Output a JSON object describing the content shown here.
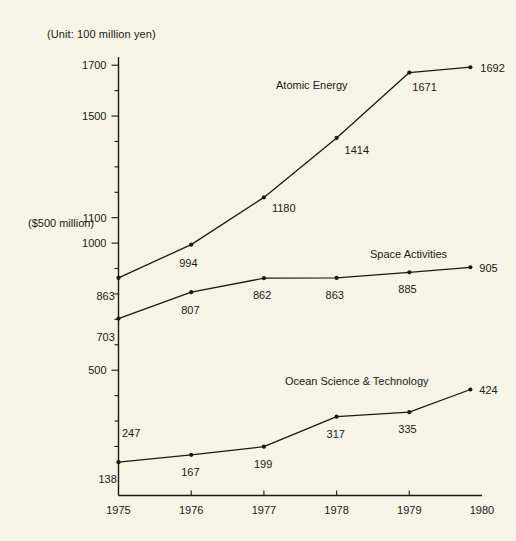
{
  "notes": {
    "unit": "(Unit: 100 million yen)",
    "axis_secondary": "($500 million)"
  },
  "floating_labels": [
    {
      "name": "floating-value-247",
      "text": "247",
      "x": 122,
      "y": 437
    }
  ],
  "chart_data": {
    "type": "line",
    "title": "",
    "subtitle": "",
    "xlabel": "",
    "ylabel": "",
    "unit_note": "(Unit: 100 million yen)",
    "secondary_axis_note": "($500 million)",
    "grid": false,
    "legend_position": "inline-labels",
    "x": [
      1975,
      1976,
      1977,
      1978,
      1979,
      1980
    ],
    "categories": [
      "1975",
      "1976",
      "1977",
      "1978",
      "1979",
      "1980"
    ],
    "xlim": [
      1975,
      1980
    ],
    "ylim": [
      0,
      1750
    ],
    "y_labeled_ticks": [
      1700,
      1500,
      1100,
      1000,
      500
    ],
    "y_minor_tick_step": 100,
    "series": [
      {
        "name": "Atomic Energy",
        "values": [
          863,
          994,
          1180,
          1414,
          1671,
          1692
        ],
        "label_text": "Atomic Energy"
      },
      {
        "name": "Space Activities",
        "values": [
          703,
          807,
          862,
          863,
          885,
          905
        ],
        "label_text": "Space Activities"
      },
      {
        "name": "Ocean Science & Technology",
        "values": [
          138,
          167,
          199,
          317,
          335,
          424
        ],
        "label_text": "Ocean Science & Technology"
      }
    ],
    "annotations": [
      {
        "text": "247",
        "note": "unmarked floating value near 1975 ocean science region"
      }
    ]
  },
  "axis": {
    "y_ticks": [
      "1700",
      "1500",
      "1100",
      "1000",
      "500"
    ],
    "x_ticks": [
      "1975",
      "1976",
      "1977",
      "1978",
      "1979",
      "1980"
    ]
  },
  "point_labels": {
    "atomic": [
      "863",
      "994",
      "1180",
      "1414",
      "1671",
      "1692"
    ],
    "space": [
      "703",
      "807",
      "862",
      "863",
      "885",
      "905"
    ],
    "ocean": [
      "138",
      "167",
      "199",
      "317",
      "335",
      "424"
    ]
  },
  "series_labels": {
    "atomic": "Atomic Energy",
    "space": "Space Activities",
    "ocean": "Ocean Science & Technology"
  }
}
